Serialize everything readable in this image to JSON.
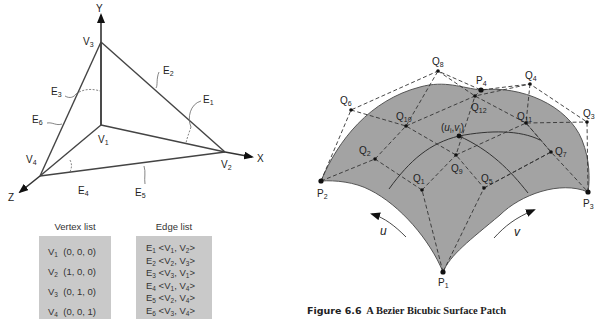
{
  "left_figure": {
    "axes": {
      "x": "X",
      "y": "Y",
      "z": "Z"
    },
    "vertices": [
      {
        "name": "V",
        "sub": "1"
      },
      {
        "name": "V",
        "sub": "2"
      },
      {
        "name": "V",
        "sub": "3"
      },
      {
        "name": "V",
        "sub": "4"
      }
    ],
    "edges": [
      {
        "name": "E",
        "sub": "1"
      },
      {
        "name": "E",
        "sub": "2"
      },
      {
        "name": "E",
        "sub": "3"
      },
      {
        "name": "E",
        "sub": "4"
      },
      {
        "name": "E",
        "sub": "5"
      },
      {
        "name": "E",
        "sub": "6"
      }
    ],
    "vertex_list": {
      "title": "Vertex list",
      "rows": [
        {
          "v": "V",
          "sub": "1",
          "coords": "(0, 0, 0)"
        },
        {
          "v": "V",
          "sub": "2",
          "coords": "(1, 0, 0)"
        },
        {
          "v": "V",
          "sub": "3",
          "coords": "(0, 1, 0)"
        },
        {
          "v": "V",
          "sub": "4",
          "coords": "(0, 0, 1)"
        }
      ]
    },
    "edge_list": {
      "title": "Edge list",
      "rows": [
        {
          "e": "E",
          "sub": "1",
          "a": "1",
          "b": "2"
        },
        {
          "e": "E",
          "sub": "2",
          "a": "2",
          "b": "3"
        },
        {
          "e": "E",
          "sub": "3",
          "a": "3",
          "b": "1"
        },
        {
          "e": "E",
          "sub": "4",
          "a": "1",
          "b": "4"
        },
        {
          "e": "E",
          "sub": "5",
          "a": "2",
          "b": "4"
        },
        {
          "e": "E",
          "sub": "6",
          "a": "3",
          "b": "4"
        }
      ]
    }
  },
  "right_figure": {
    "corner_points": [
      {
        "name": "P",
        "sub": "1"
      },
      {
        "name": "P",
        "sub": "2"
      },
      {
        "name": "P",
        "sub": "3"
      },
      {
        "name": "P",
        "sub": "4"
      }
    ],
    "control_points": [
      {
        "name": "Q",
        "sub": "1"
      },
      {
        "name": "Q",
        "sub": "2"
      },
      {
        "name": "Q",
        "sub": "3"
      },
      {
        "name": "Q",
        "sub": "4"
      },
      {
        "name": "Q",
        "sub": "5"
      },
      {
        "name": "Q",
        "sub": "6"
      },
      {
        "name": "Q",
        "sub": "7"
      },
      {
        "name": "Q",
        "sub": "8"
      },
      {
        "name": "Q",
        "sub": "9"
      },
      {
        "name": "Q",
        "sub": "10"
      },
      {
        "name": "Q",
        "sub": "11"
      },
      {
        "name": "Q",
        "sub": "12"
      }
    ],
    "surface_point": {
      "open": "(",
      "u": "u",
      "usub": "i",
      "sep": ",",
      "v": "v",
      "vsub": "i",
      "close": ")"
    },
    "param_labels": {
      "u": "u",
      "v": "v"
    },
    "colors": {
      "surface": "#a3a3a3",
      "edge": "#444444",
      "line": "#333333"
    }
  },
  "caption": {
    "number": "Figure 6.6",
    "title": "A Bezier Bicubic Surface Patch"
  }
}
